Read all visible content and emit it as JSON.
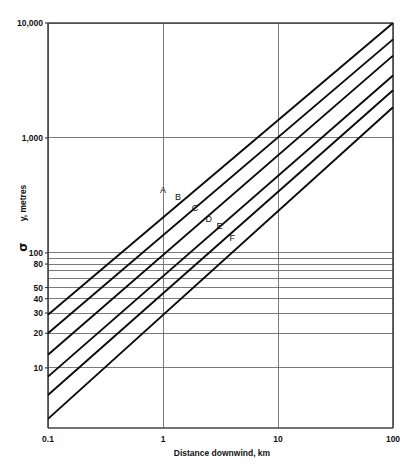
{
  "chart_data": {
    "type": "line",
    "title": "",
    "subtitle": "",
    "xlabel": "Distance downwind, km",
    "ylabel": "σ y, metres",
    "ylabel_symbol": "σ",
    "ylabel_rest": " y, metres",
    "xscale": "log",
    "yscale": "log",
    "xlim": [
      0.1,
      100
    ],
    "ylim": [
      3,
      10000
    ],
    "grid": true,
    "legend_position": "inline-curve-labels",
    "x_ticks": [
      "0.1",
      "1",
      "10",
      "100"
    ],
    "x_tick_values": [
      0.1,
      1,
      10,
      100
    ],
    "y_ticks": [
      "10,000",
      "1,000",
      "100",
      "80",
      "50",
      "40",
      "30",
      "20",
      "10"
    ],
    "y_tick_values": [
      10000,
      1000,
      100,
      80,
      50,
      40,
      30,
      20,
      10
    ],
    "y_gridline_values": [
      10000,
      1000,
      100,
      90,
      80,
      70,
      60,
      50,
      40,
      30,
      20,
      10
    ],
    "x_gridline_values": [
      0.1,
      1,
      10,
      100
    ],
    "series": [
      {
        "name": "A",
        "label": "A",
        "label_x": 1.0,
        "label_y": 330,
        "x": [
          0.1,
          100
        ],
        "values": [
          29,
          10000
        ]
      },
      {
        "name": "B",
        "label": "B",
        "label_x": 1.35,
        "label_y": 290,
        "x": [
          0.1,
          100
        ],
        "values": [
          20,
          7200
        ]
      },
      {
        "name": "C",
        "label": "C",
        "label_x": 1.9,
        "label_y": 230,
        "x": [
          0.1,
          100
        ],
        "values": [
          13,
          5200
        ]
      },
      {
        "name": "D",
        "label": "D",
        "label_x": 2.5,
        "label_y": 185,
        "x": [
          0.1,
          100
        ],
        "values": [
          8.4,
          3500
        ]
      },
      {
        "name": "E",
        "label": "E",
        "label_x": 3.1,
        "label_y": 160,
        "x": [
          0.1,
          100
        ],
        "values": [
          5.8,
          2600
        ]
      },
      {
        "name": "F",
        "label": "F",
        "label_x": 4.0,
        "label_y": 126,
        "x": [
          0.1,
          100
        ],
        "values": [
          3.6,
          1850
        ]
      }
    ],
    "colors": {
      "curve": "#0a0a0a",
      "grid": "#6b6b6b",
      "frame": "#444444",
      "background": "#ffffff",
      "text": "#111111"
    }
  }
}
